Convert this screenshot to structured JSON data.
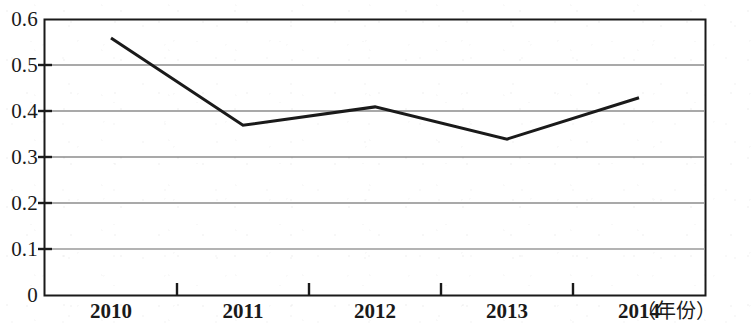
{
  "chart_data": {
    "type": "line",
    "title": "",
    "subtitle": "",
    "xlabel": "年份",
    "xlabel_display": "（年份）",
    "ylabel": "",
    "categories": [
      "2010",
      "2011",
      "2012",
      "2013",
      "2014"
    ],
    "x": [
      2010,
      2011,
      2012,
      2013,
      2014
    ],
    "values": [
      0.56,
      0.37,
      0.41,
      0.34,
      0.43
    ],
    "series": [
      {
        "name": "",
        "values": [
          0.56,
          0.37,
          0.41,
          0.34,
          0.43
        ]
      }
    ],
    "ylim": [
      0,
      0.6
    ],
    "y_ticks": [
      0,
      0.1,
      0.2,
      0.3,
      0.4,
      0.5,
      0.6
    ],
    "y_tick_labels": [
      "0",
      "0.1",
      "0.2",
      "0.3",
      "0.4",
      "0.5",
      "0.6"
    ],
    "x_tick_labels": [
      "2010",
      "2011",
      "2012",
      "2013",
      "2014"
    ],
    "grid": true,
    "grid_axis": "y",
    "legend": false,
    "legend_position": "none",
    "markers": false,
    "line_color": "#1a1a1a",
    "grid_color": "#808080",
    "axis_color": "#1a1a1a",
    "plot_background": "#ffffff",
    "annotations": []
  },
  "axes": {
    "y_labels": [
      {
        "text": "0.6",
        "value": 0.6
      },
      {
        "text": "0.5",
        "value": 0.5
      },
      {
        "text": "0.4",
        "value": 0.4
      },
      {
        "text": "0.3",
        "value": 0.3
      },
      {
        "text": "0.2",
        "value": 0.2
      },
      {
        "text": "0.1",
        "value": 0.1
      },
      {
        "text": "0",
        "value": 0
      }
    ],
    "x_labels": [
      {
        "text": "2010",
        "value": 2010
      },
      {
        "text": "2011",
        "value": 2011
      },
      {
        "text": "2012",
        "value": 2012
      },
      {
        "text": "2013",
        "value": 2013
      },
      {
        "text": "2014",
        "value": 2014
      }
    ],
    "x_unit": "（年份）"
  }
}
